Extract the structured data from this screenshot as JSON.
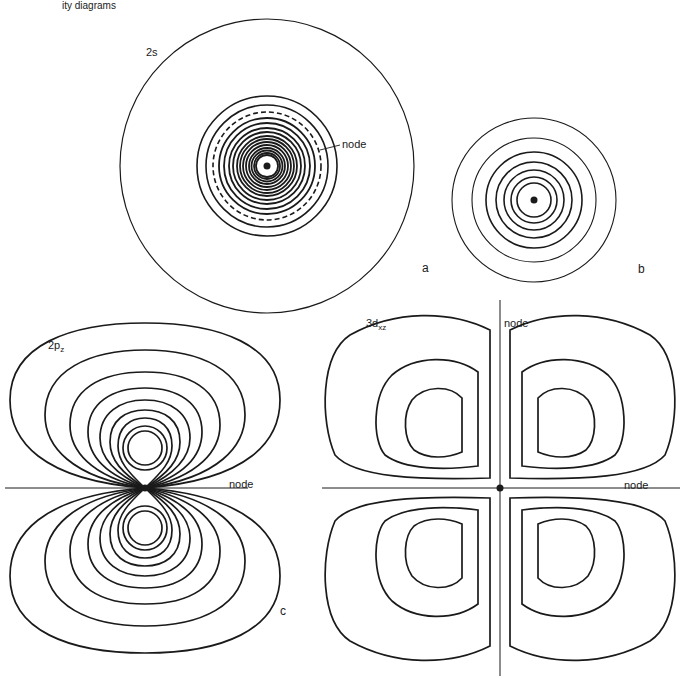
{
  "figure": {
    "caption_fragment": "ity diagrams",
    "panels": [
      {
        "id": "a",
        "letter": "a",
        "orbital_label": "2s",
        "node_label": "node",
        "type": "concentric-circles",
        "ring_count_inner": 14,
        "has_dashed_node_ring": true
      },
      {
        "id": "b",
        "letter": "b",
        "type": "concentric-circles",
        "ring_count": 7
      },
      {
        "id": "c",
        "letter": "c",
        "orbital_label_main": "2p",
        "orbital_label_sub": "z",
        "node_label": "node",
        "type": "two-lobe-contours"
      },
      {
        "id": "d",
        "orbital_label_main": "3d",
        "orbital_label_sub": "xz",
        "node_label_vertical": "node",
        "node_label_horizontal": "node",
        "type": "four-lobe-contours"
      }
    ],
    "colors": {
      "ink": "#1a1a1a",
      "background": "#ffffff"
    }
  }
}
